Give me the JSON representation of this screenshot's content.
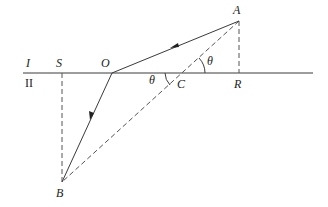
{
  "diagram": {
    "type": "optics-refraction",
    "colors": {
      "line": "#3a3a3a",
      "dashed": "#555555",
      "text": "#222222",
      "background": "#ffffff"
    },
    "interface": {
      "label_top": "I",
      "label_bottom": "II"
    },
    "points": {
      "A": {
        "label": "A",
        "x": 239,
        "y": 21
      },
      "O": {
        "label": "O",
        "x": 112,
        "y": 73
      },
      "B": {
        "label": "B",
        "x": 62,
        "y": 182
      },
      "C": {
        "label": "C",
        "x": 183,
        "y": 73
      },
      "R": {
        "label": "R",
        "x": 239,
        "y": 73
      },
      "S": {
        "label": "S",
        "x": 62,
        "y": 73
      }
    },
    "angles": [
      {
        "label": "θ",
        "at": "C",
        "side": "right-above"
      },
      {
        "label": "θ",
        "at": "C",
        "side": "left-below"
      }
    ],
    "segments": [
      {
        "from": "A",
        "to": "O",
        "style": "solid",
        "arrow": "toward O"
      },
      {
        "from": "O",
        "to": "B",
        "style": "solid",
        "arrow": "toward B"
      },
      {
        "from": "A",
        "to": "B",
        "style": "dashed"
      },
      {
        "from": "A",
        "to": "R",
        "style": "dashed"
      },
      {
        "from": "S",
        "to": "B",
        "style": "dashed"
      }
    ]
  }
}
